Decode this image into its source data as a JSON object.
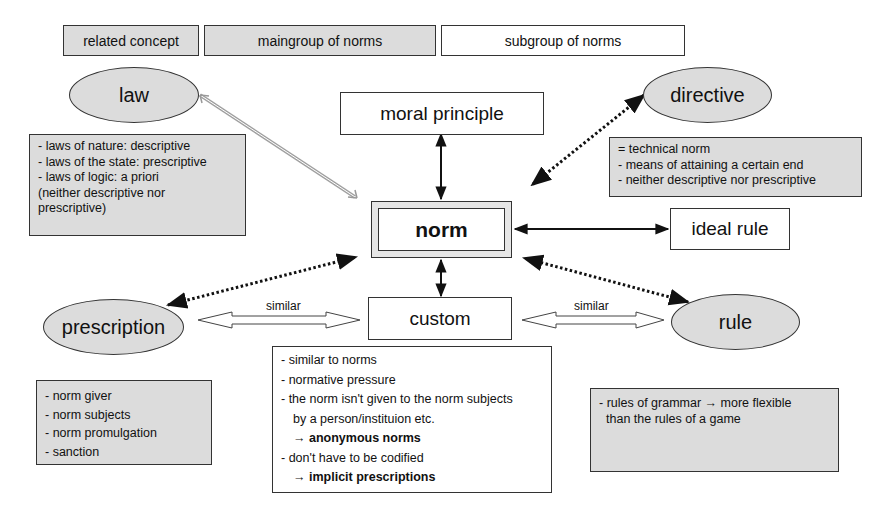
{
  "legend": {
    "related_concept": "related concept",
    "maingroup": "maingroup of norms",
    "subgroup": "subgroup of norms"
  },
  "nodes": {
    "law": "law",
    "directive": "directive",
    "moral_principle": "moral principle",
    "norm": "norm",
    "ideal_rule": "ideal rule",
    "prescription": "prescription",
    "custom": "custom",
    "rule": "rule"
  },
  "edge_labels": {
    "prescription_custom": "similar",
    "custom_rule": "similar"
  },
  "notes": {
    "law": [
      "- laws of nature: descriptive",
      "- laws of the state: prescriptive",
      "- laws of logic: a priori",
      "(neither descriptive nor",
      "prescriptive)"
    ],
    "directive": [
      "= technical norm",
      "- means of attaining a certain end",
      "- neither descriptive nor prescriptive"
    ],
    "prescription": [
      "- norm giver",
      "- norm subjects",
      "- norm promulgation",
      "- sanction"
    ],
    "custom": {
      "l1": "- similar to norms",
      "l2": "- normative pressure",
      "l3": "- the norm isn't given to the norm subjects",
      "l4": "by a person/instituion etc.",
      "l5_arrow": "→ ",
      "l5_bold": "anonymous norms",
      "l6": "- don't have to be codified",
      "l7_arrow": "→ ",
      "l7_bold": "implicit prescriptions"
    },
    "rule": {
      "l1": "- rules of grammar → more flexible",
      "l2": "than the rules of a game"
    }
  },
  "colors": {
    "gray_fill": "#dcdcdc",
    "stroke": "#222222",
    "law_arrow": "#9a9a9a"
  }
}
